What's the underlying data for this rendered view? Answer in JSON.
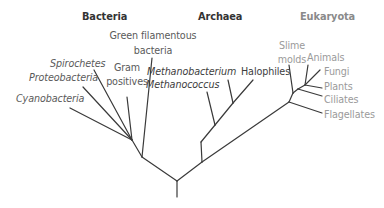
{
  "diagram": {
    "type": "phylogenetic-tree",
    "domains": [
      {
        "name": "Bacteria",
        "color": "#333333"
      },
      {
        "name": "Archaea",
        "color": "#333333"
      },
      {
        "name": "Eukaryota",
        "color": "#8a8a8a"
      }
    ],
    "bacteria": {
      "header": "Bacteria",
      "taxa": {
        "green_filamentous_1": "Green filamentous",
        "green_filamentous_2": "bacteria",
        "gram_1": "Gram",
        "gram_2": "positives",
        "spirochetes": "Spirochetes",
        "proteobacteria": "Proteobacteria",
        "cyanobacteria": "Cyanobacteria"
      }
    },
    "archaea": {
      "header": "Archaea",
      "taxa": {
        "methanobacterium": "Methanobacterium",
        "methanococcus": "Methanococcus",
        "halophiles": "Halophiles"
      }
    },
    "eukaryota": {
      "header": "Eukaryota",
      "taxa": {
        "slime_1": "Slime",
        "slime_2": "molds",
        "animals": "Animals",
        "fungi": "Fungi",
        "plants": "Plants",
        "ciliates": "Ciliates",
        "flagellates": "Flagellates"
      }
    },
    "line_color": "#3a3a3a"
  }
}
